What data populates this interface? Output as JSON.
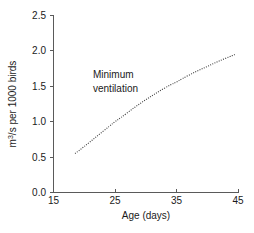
{
  "chart_data": {
    "type": "line",
    "title": "",
    "subtitle": "",
    "xlabel": "Age (days)",
    "ylabel": "m3/s per 1000 birds",
    "ylabel_parts": {
      "pre": "m",
      "sup": "3",
      "post": "/s per 1000 birds"
    },
    "xlim": [
      15,
      45
    ],
    "ylim": [
      0.0,
      2.5
    ],
    "xticks": [
      "15",
      "25",
      "35",
      "45"
    ],
    "xtick_values": [
      15,
      25,
      35,
      45
    ],
    "yticks": [
      "0.0",
      "0.5",
      "1.0",
      "1.5",
      "2.0",
      "2.5"
    ],
    "ytick_values": [
      0.0,
      0.5,
      1.0,
      1.5,
      2.0,
      2.5
    ],
    "grid": false,
    "legend": "none",
    "series": [
      {
        "name": "Minimum ventilation",
        "style": "dotted",
        "color": "#3c3c3c",
        "x": [
          18.5,
          20,
          22,
          24,
          25,
          26,
          28,
          30,
          32,
          34,
          35,
          36,
          38,
          40,
          42,
          44,
          44.5
        ],
        "values": [
          0.55,
          0.65,
          0.79,
          0.93,
          1.0,
          1.06,
          1.19,
          1.31,
          1.42,
          1.52,
          1.56,
          1.61,
          1.7,
          1.78,
          1.86,
          1.93,
          1.95
        ]
      }
    ],
    "annotations": [
      {
        "name": "minimum-ventilation-label",
        "line1": "Minimum",
        "line2": "ventilation",
        "x": 27,
        "y": 1.72
      }
    ]
  }
}
